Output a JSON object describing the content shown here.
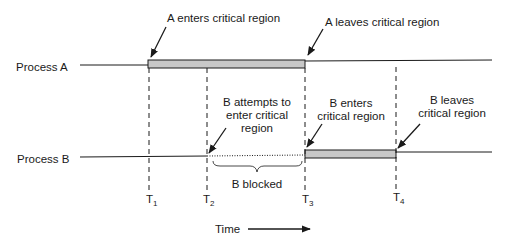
{
  "diagram": {
    "processes": [
      {
        "name": "Process A",
        "critical_start": "T1",
        "critical_end": "T3"
      },
      {
        "name": "Process B",
        "critical_start": "T3",
        "critical_end": "T4",
        "blocked_from": "T2",
        "blocked_to": "T3"
      }
    ],
    "time_marks": [
      {
        "label": "T",
        "sub": "1"
      },
      {
        "label": "T",
        "sub": "2"
      },
      {
        "label": "T",
        "sub": "3"
      },
      {
        "label": "T",
        "sub": "4"
      }
    ],
    "annotations": {
      "a_enters": "A enters critical region",
      "a_leaves": "A leaves critical region",
      "b_attempts": [
        "B attempts to",
        "enter critical",
        "region"
      ],
      "b_enters": [
        "B enters",
        "critical region"
      ],
      "b_leaves": [
        "B leaves",
        "critical region"
      ],
      "b_blocked": "B blocked"
    },
    "time_axis_label": "Time",
    "colors": {
      "bar_fill": "#c8c8c8",
      "line": "#1a1a1a"
    }
  }
}
